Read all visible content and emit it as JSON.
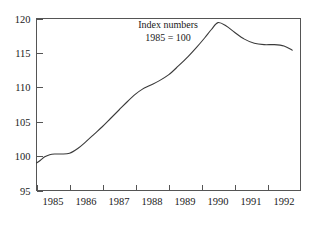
{
  "chart_data": {
    "type": "line",
    "title": "",
    "annotation_lines": [
      "Index numbers",
      "1985 = 100"
    ],
    "xlabel": "",
    "ylabel": "",
    "ylim": [
      95,
      120
    ],
    "xlim": [
      1985,
      1993
    ],
    "y_ticks": [
      95,
      100,
      105,
      110,
      115,
      120
    ],
    "y_tick_labels": [
      "95",
      "100",
      "105",
      "110",
      "115",
      "120"
    ],
    "x_tick_labels": [
      "1985",
      "1986",
      "1987",
      "1988",
      "1989",
      "1990",
      "1991",
      "1992"
    ],
    "x_tick_values": [
      1985,
      1986,
      1987,
      1988,
      1989,
      1990,
      1991,
      1992
    ],
    "grid": false,
    "legend": false,
    "line_color": "#3a3a3a",
    "frame_color": "#555555",
    "background_color": "#ffffff",
    "series": [
      {
        "name": "Index",
        "x": [
          1985.0,
          1985.12,
          1985.25,
          1985.4,
          1985.55,
          1985.75,
          1986.0,
          1986.25,
          1986.5,
          1986.75,
          1987.0,
          1987.25,
          1987.5,
          1987.75,
          1988.0,
          1988.2,
          1988.45,
          1988.7,
          1989.0,
          1989.3,
          1989.6,
          1989.85,
          1990.1,
          1990.3,
          1990.5,
          1990.75,
          1991.0,
          1991.3,
          1991.6,
          1991.9,
          1992.2,
          1992.5,
          1992.75
        ],
        "values": [
          99.0,
          99.4,
          99.9,
          100.2,
          100.3,
          100.3,
          100.4,
          101.1,
          102.1,
          103.2,
          104.3,
          105.5,
          106.7,
          107.9,
          109.0,
          109.7,
          110.3,
          110.9,
          111.8,
          113.1,
          114.5,
          115.8,
          117.2,
          118.4,
          119.4,
          118.9,
          118.0,
          117.0,
          116.4,
          116.2,
          116.2,
          116.0,
          115.4
        ]
      }
    ]
  },
  "axis_annotation": {
    "line1": "Index numbers",
    "line2": "1985 = 100"
  }
}
